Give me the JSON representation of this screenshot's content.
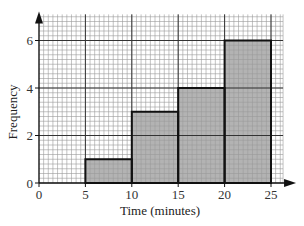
{
  "chart_data": {
    "type": "bar",
    "subtype": "histogram",
    "title": "",
    "xlabel": "Time (minutes)",
    "ylabel": "Frequency",
    "xlim": [
      0,
      26.3
    ],
    "ylim": [
      0,
      7.1
    ],
    "x_ticks": [
      0,
      5,
      10,
      15,
      20,
      25
    ],
    "y_ticks": [
      0,
      2,
      4,
      6
    ],
    "grid": true,
    "grid_style": "graph paper (major every 5 x-units / 2 y-units, minor every 0.5 x / 0.2 y)",
    "legend": null,
    "bins": [
      {
        "from": 5,
        "to": 10,
        "frequency": 1
      },
      {
        "from": 10,
        "to": 15,
        "frequency": 3
      },
      {
        "from": 15,
        "to": 20,
        "frequency": 4
      },
      {
        "from": 20,
        "to": 25,
        "frequency": 6
      }
    ],
    "categories": [
      "5-10",
      "10-15",
      "15-20",
      "20-25"
    ],
    "values": [
      1,
      3,
      4,
      6
    ],
    "colors": {
      "bar_fill": "#9a9a9a",
      "bar_edge": "#111111",
      "grid_minor": "#9a9a9a",
      "grid_major": "#333333"
    }
  }
}
